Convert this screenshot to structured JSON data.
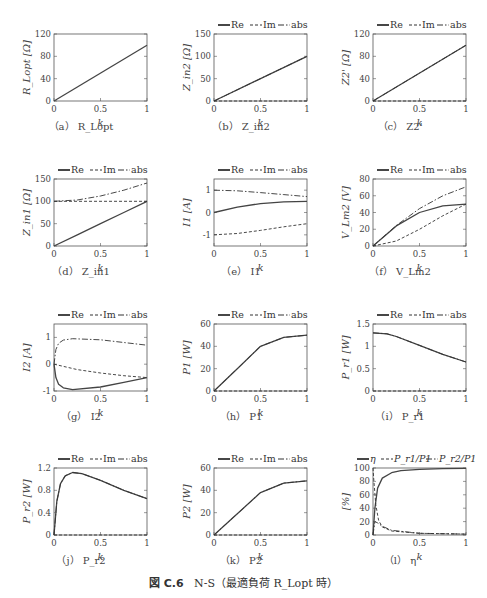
{
  "figure": {
    "label": "図 C.6",
    "title": "N-S（最適負荷 R_Lopt 時）"
  },
  "legend_default": [
    "Re",
    "Im",
    "abs"
  ],
  "chart_data": [
    {
      "id": "a",
      "type": "line",
      "caption": "（a） R_Lopt",
      "ylabel": "R_Lopt [Ω]",
      "xlabel": "k",
      "xlim": [
        0,
        1
      ],
      "ylim": [
        0,
        120
      ],
      "yticks": [
        0,
        40,
        80,
        120
      ],
      "xticks": [
        0,
        0.5,
        1
      ],
      "legend": [],
      "series": [
        {
          "name": "R_Lopt",
          "style": "solid",
          "x": [
            0,
            1
          ],
          "y": [
            0,
            100
          ]
        }
      ]
    },
    {
      "id": "b",
      "type": "line",
      "caption": "（b） Z_in2",
      "ylabel": "Z_in2 [Ω]",
      "xlabel": "k",
      "xlim": [
        0,
        1
      ],
      "ylim": [
        0,
        150
      ],
      "yticks": [
        0,
        50,
        100,
        150
      ],
      "xticks": [
        0,
        0.5,
        1
      ],
      "legend": [
        "Re",
        "Im",
        "abs"
      ],
      "series": [
        {
          "name": "Re",
          "style": "solid",
          "x": [
            0,
            1
          ],
          "y": [
            0,
            100
          ]
        },
        {
          "name": "Im",
          "style": "dashed",
          "x": [
            0,
            1
          ],
          "y": [
            0,
            0
          ]
        },
        {
          "name": "abs",
          "style": "dashdot",
          "x": [
            0,
            1
          ],
          "y": [
            0,
            100
          ]
        }
      ]
    },
    {
      "id": "c",
      "type": "line",
      "caption": "（c） Z2'",
      "ylabel": "Z2' [Ω]",
      "xlabel": "k",
      "xlim": [
        0,
        1
      ],
      "ylim": [
        0,
        120
      ],
      "yticks": [
        0,
        40,
        80,
        120
      ],
      "xticks": [
        0,
        0.5,
        1
      ],
      "legend": [
        "Re",
        "Im",
        "abs"
      ],
      "series": [
        {
          "name": "Re",
          "style": "solid",
          "x": [
            0,
            1
          ],
          "y": [
            0,
            100
          ]
        },
        {
          "name": "Im",
          "style": "dashed",
          "x": [
            0,
            1
          ],
          "y": [
            0,
            0
          ]
        },
        {
          "name": "abs",
          "style": "dashdot",
          "x": [
            0,
            1
          ],
          "y": [
            0,
            100
          ]
        }
      ]
    },
    {
      "id": "d",
      "type": "line",
      "caption": "（d） Z_in1",
      "ylabel": "Z_in1 [Ω]",
      "xlabel": "k",
      "xlim": [
        0,
        1
      ],
      "ylim": [
        0,
        150
      ],
      "yticks": [
        0,
        50,
        100,
        150
      ],
      "xticks": [
        0,
        0.5,
        1
      ],
      "legend": [
        "Re",
        "Im",
        "abs"
      ],
      "series": [
        {
          "name": "Re",
          "style": "solid",
          "x": [
            0,
            0.25,
            0.5,
            0.75,
            1
          ],
          "y": [
            0,
            25,
            50,
            75,
            100
          ]
        },
        {
          "name": "Im",
          "style": "dashed",
          "x": [
            0,
            1
          ],
          "y": [
            100,
            100
          ]
        },
        {
          "name": "abs",
          "style": "dashdot",
          "x": [
            0,
            0.25,
            0.5,
            0.75,
            1
          ],
          "y": [
            100,
            103,
            112,
            125,
            141
          ]
        }
      ]
    },
    {
      "id": "e",
      "type": "line",
      "caption": "（e） I1",
      "ylabel": "I1 [A]",
      "xlabel": "k",
      "xlim": [
        0,
        1
      ],
      "ylim": [
        -1.5,
        1.5
      ],
      "yticks": [
        -1,
        0,
        1
      ],
      "xticks": [
        0,
        0.5,
        1
      ],
      "legend": [
        "Re",
        "Im",
        "abs"
      ],
      "series": [
        {
          "name": "Re",
          "style": "solid",
          "x": [
            0,
            0.25,
            0.5,
            0.75,
            1
          ],
          "y": [
            0,
            0.24,
            0.4,
            0.48,
            0.5
          ]
        },
        {
          "name": "Im",
          "style": "dashed",
          "x": [
            0,
            0.25,
            0.5,
            0.75,
            1
          ],
          "y": [
            -1,
            -0.94,
            -0.8,
            -0.64,
            -0.5
          ]
        },
        {
          "name": "abs",
          "style": "dashdot",
          "x": [
            0,
            0.25,
            0.5,
            0.75,
            1
          ],
          "y": [
            1,
            0.97,
            0.89,
            0.8,
            0.71
          ]
        }
      ]
    },
    {
      "id": "f",
      "type": "line",
      "caption": "（f） V_Lm2",
      "ylabel": "V_Lm2 [V]",
      "xlabel": "k",
      "xlim": [
        0,
        1
      ],
      "ylim": [
        0,
        80
      ],
      "yticks": [
        0,
        20,
        40,
        60,
        80
      ],
      "xticks": [
        0,
        0.5,
        1
      ],
      "legend": [
        "Re",
        "Im",
        "abs"
      ],
      "series": [
        {
          "name": "Re",
          "style": "solid",
          "x": [
            0,
            0.25,
            0.5,
            0.75,
            1
          ],
          "y": [
            0,
            24,
            40,
            48,
            50
          ]
        },
        {
          "name": "Im",
          "style": "dashed",
          "x": [
            0,
            0.25,
            0.5,
            0.75,
            1
          ],
          "y": [
            0,
            6,
            20,
            36,
            50
          ]
        },
        {
          "name": "abs",
          "style": "dashdot",
          "x": [
            0,
            0.25,
            0.5,
            0.75,
            1
          ],
          "y": [
            0,
            24.5,
            44.7,
            60,
            70.7
          ]
        }
      ]
    },
    {
      "id": "g",
      "type": "line",
      "caption": "（g） I2",
      "ylabel": "I2 [A]",
      "xlabel": "k",
      "xlim": [
        0,
        1
      ],
      "ylim": [
        -1,
        1.5
      ],
      "yticks": [
        -1,
        0,
        1
      ],
      "xticks": [
        0,
        0.5,
        1
      ],
      "legend": [
        "Re",
        "Im",
        "abs"
      ],
      "series": [
        {
          "name": "Re",
          "style": "solid",
          "x": [
            0,
            0.02,
            0.05,
            0.1,
            0.2,
            0.5,
            0.75,
            1
          ],
          "y": [
            0,
            -0.5,
            -0.75,
            -0.88,
            -0.95,
            -0.85,
            -0.68,
            -0.5
          ]
        },
        {
          "name": "Im",
          "style": "dashed",
          "x": [
            0,
            0.25,
            0.5,
            0.75,
            1
          ],
          "y": [
            0,
            -0.2,
            -0.33,
            -0.43,
            -0.5
          ]
        },
        {
          "name": "abs",
          "style": "dashdot",
          "x": [
            0,
            0.02,
            0.05,
            0.1,
            0.2,
            0.5,
            0.75,
            1
          ],
          "y": [
            0,
            0.55,
            0.78,
            0.9,
            0.95,
            0.91,
            0.81,
            0.71
          ]
        }
      ]
    },
    {
      "id": "h",
      "type": "line",
      "caption": "（h） P1",
      "ylabel": "P1 [W]",
      "xlabel": "k",
      "xlim": [
        0,
        1
      ],
      "ylim": [
        0,
        60
      ],
      "yticks": [
        0,
        20,
        40,
        60
      ],
      "xticks": [
        0,
        0.5,
        1
      ],
      "legend": [
        "Re",
        "Im",
        "abs"
      ],
      "series": [
        {
          "name": "Re",
          "style": "solid",
          "x": [
            0,
            0.25,
            0.5,
            0.75,
            1
          ],
          "y": [
            0,
            20,
            40,
            48,
            50
          ]
        },
        {
          "name": "Im",
          "style": "dashed",
          "x": [
            0,
            1
          ],
          "y": [
            0,
            0
          ]
        },
        {
          "name": "abs",
          "style": "dashdot",
          "x": [
            0,
            0.25,
            0.5,
            0.75,
            1
          ],
          "y": [
            0,
            20,
            40,
            48,
            50
          ]
        }
      ]
    },
    {
      "id": "i",
      "type": "line",
      "caption": "（i） P_r1",
      "ylabel": "P_r1 [W]",
      "xlabel": "k",
      "xlim": [
        0,
        1
      ],
      "ylim": [
        0,
        1.5
      ],
      "yticks": [
        0,
        0.5,
        1,
        1.5
      ],
      "xticks": [
        0,
        0.5,
        1
      ],
      "legend": [
        "Re",
        "Im",
        "abs"
      ],
      "series": [
        {
          "name": "Re",
          "style": "solid",
          "x": [
            0,
            0.15,
            0.25,
            0.5,
            0.75,
            1
          ],
          "y": [
            1.3,
            1.28,
            1.22,
            1.02,
            0.82,
            0.65
          ]
        },
        {
          "name": "Im",
          "style": "dashed",
          "x": [
            0,
            1
          ],
          "y": [
            0,
            0
          ]
        },
        {
          "name": "abs",
          "style": "dashdot",
          "x": [
            0,
            0.15,
            0.25,
            0.5,
            0.75,
            1
          ],
          "y": [
            1.3,
            1.28,
            1.22,
            1.02,
            0.82,
            0.65
          ]
        }
      ]
    },
    {
      "id": "j",
      "type": "line",
      "caption": "（j） P_r2",
      "ylabel": "P_r2 [W]",
      "xlabel": "k",
      "xlim": [
        0,
        1
      ],
      "ylim": [
        0,
        1.2
      ],
      "yticks": [
        0,
        0.4,
        0.8,
        1.2
      ],
      "xticks": [
        0,
        0.5,
        1
      ],
      "legend": [
        "Re",
        "Im",
        "abs"
      ],
      "series": [
        {
          "name": "Re",
          "style": "solid",
          "x": [
            0,
            0.03,
            0.07,
            0.12,
            0.2,
            0.3,
            0.5,
            0.75,
            1
          ],
          "y": [
            0,
            0.6,
            0.92,
            1.06,
            1.12,
            1.1,
            0.98,
            0.8,
            0.65
          ]
        },
        {
          "name": "Im",
          "style": "dashed",
          "x": [
            0,
            1
          ],
          "y": [
            0,
            0
          ]
        },
        {
          "name": "abs",
          "style": "dashdot",
          "x": [
            0,
            0.03,
            0.07,
            0.12,
            0.2,
            0.3,
            0.5,
            0.75,
            1
          ],
          "y": [
            0,
            0.6,
            0.92,
            1.06,
            1.12,
            1.1,
            0.98,
            0.8,
            0.65
          ]
        }
      ]
    },
    {
      "id": "k",
      "type": "line",
      "caption": "（k） P2",
      "ylabel": "P2 [W]",
      "xlabel": "k",
      "xlim": [
        0,
        1
      ],
      "ylim": [
        0,
        60
      ],
      "yticks": [
        0,
        20,
        40,
        60
      ],
      "xticks": [
        0,
        0.5,
        1
      ],
      "legend": [
        "Re",
        "Im",
        "abs"
      ],
      "series": [
        {
          "name": "Re",
          "style": "solid",
          "x": [
            0,
            0.25,
            0.5,
            0.75,
            1
          ],
          "y": [
            0,
            19,
            38,
            46.5,
            48.5
          ]
        },
        {
          "name": "Im",
          "style": "dashed",
          "x": [
            0,
            1
          ],
          "y": [
            0,
            0
          ]
        },
        {
          "name": "abs",
          "style": "dashdot",
          "x": [
            0,
            0.25,
            0.5,
            0.75,
            1
          ],
          "y": [
            0,
            19,
            38,
            46.5,
            48.5
          ]
        }
      ]
    },
    {
      "id": "l",
      "type": "line",
      "caption": "（l） η",
      "ylabel": "[%]",
      "xlabel": "k",
      "xlim": [
        0,
        1
      ],
      "ylim": [
        0,
        100
      ],
      "yticks": [
        0,
        20,
        40,
        60,
        80,
        100
      ],
      "xticks": [
        0,
        0.5,
        1
      ],
      "legend": [
        "η",
        "P_r1/P1",
        "P_r2/P1"
      ],
      "series": [
        {
          "name": "η",
          "style": "solid",
          "x": [
            0,
            0.02,
            0.05,
            0.1,
            0.2,
            0.3,
            0.5,
            0.75,
            1
          ],
          "y": [
            0,
            40,
            70,
            85,
            93,
            96,
            98,
            99,
            99.5
          ]
        },
        {
          "name": "P_r1/P1",
          "style": "dashed",
          "x": [
            0,
            0.01,
            0.03,
            0.06,
            0.1,
            0.2,
            0.5,
            1
          ],
          "y": [
            100,
            80,
            45,
            22,
            12,
            6,
            2.5,
            1.3
          ]
        },
        {
          "name": "P_r2/P1",
          "style": "dashdot",
          "x": [
            0,
            0.02,
            0.05,
            0.1,
            0.2,
            0.5,
            1
          ],
          "y": [
            0,
            20,
            18,
            13,
            7,
            2.5,
            1.3
          ]
        }
      ]
    }
  ]
}
